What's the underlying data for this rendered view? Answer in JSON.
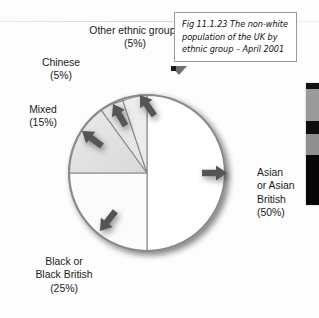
{
  "figure": {
    "caption": "Fig 11.1.23 The non-white\npopulation of the UK by\nethnic group – April 2001",
    "caption_marker": "caption-pointer-arrow"
  },
  "chart_data": {
    "type": "pie",
    "title": "Fig 11.1.23 The non-white population of the UK by ethnic group – April 2001",
    "xlabel": "",
    "ylabel": "",
    "units": "percent",
    "start_angle_deg": 0,
    "direction": "clockwise",
    "categories": [
      "Asian or Asian British",
      "Black or Black British",
      "Mixed",
      "Chinese",
      "Other ethnic groups"
    ],
    "values": [
      50,
      25,
      15,
      5,
      5
    ],
    "labels": [
      "Asian\nor Asian\nBritish\n(50%)",
      "Black or\nBlack British\n(25%)",
      "Mixed\n(15%)",
      "Chinese\n(5%)",
      "Other ethnic groups\n(5%)"
    ],
    "slice_colors": [
      "#ffffff",
      "#fcfcfc",
      "#e2e2e2",
      "#e7e7e7",
      "#ededed"
    ],
    "outline_color": "#8a8a8a",
    "legend": "none",
    "grid": false
  },
  "labels": {
    "other": "Other ethnic groups\n(5%)",
    "chinese": "Chinese\n(5%)",
    "mixed": "Mixed\n(15%)",
    "black": "Black or\nBlack British\n(25%)",
    "asian": "Asian\nor Asian\nBritish\n(50%)"
  },
  "annotations": {
    "pointer_other": "arrow-icon",
    "pointer_chinese": "arrow-icon",
    "pointer_mixed": "arrow-icon",
    "pointer_black": "arrow-icon",
    "pointer_asian": "arrow-icon"
  },
  "edge_strip": {
    "name": "page-edge-colour-bar",
    "bands": [
      {
        "color": "#111111",
        "height_pct": 5
      },
      {
        "color": "#9a9a9a",
        "height_pct": 26
      },
      {
        "color": "#0d0d0d",
        "height_pct": 11
      },
      {
        "color": "#8f8f8f",
        "height_pct": 17
      },
      {
        "color": "#070707",
        "height_pct": 41
      }
    ]
  },
  "colors": {
    "pie_outline": "#8a8a8a",
    "slice_gray": "#e3e3e3",
    "arrow_dark": "#4b4b4b",
    "text": "#1b1b1b",
    "caption_border": "#9a9a9a"
  }
}
